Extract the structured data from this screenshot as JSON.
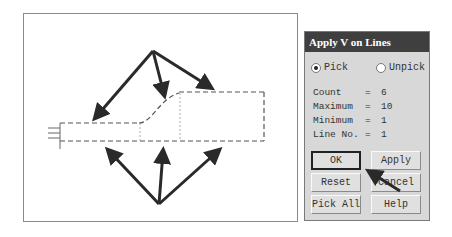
{
  "dialog": {
    "title": "Apply V on Lines",
    "radio_pick": "Pick",
    "radio_unpick": "Unpick",
    "selected": "Pick",
    "info": [
      {
        "label": "Count",
        "eq": "=",
        "value": "6"
      },
      {
        "label": "Maximum",
        "eq": "=",
        "value": "10"
      },
      {
        "label": "Minimum",
        "eq": "=",
        "value": "1"
      },
      {
        "label": "Line No.",
        "eq": "=",
        "value": "1"
      }
    ],
    "buttons": {
      "ok": "OK",
      "apply": "Apply",
      "reset": "Reset",
      "cancel": "Cancel",
      "pick_all": "Pick All",
      "help": "Help"
    }
  },
  "colors": {
    "titlebar": "#3f3f3f",
    "dialog_bg": "#d8d8d8",
    "arrow": "#2a2a2a"
  }
}
